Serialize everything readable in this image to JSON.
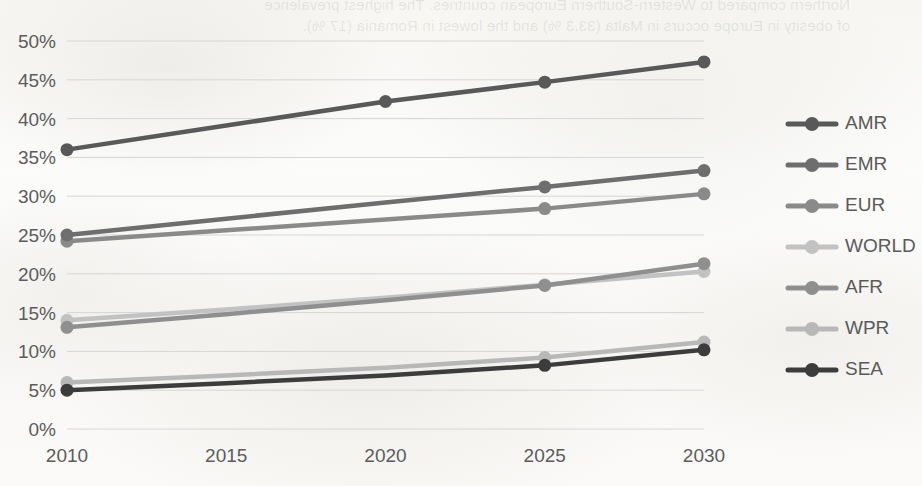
{
  "background": {
    "bleed_through_text": [
      "Northern compared to Western-Southern European countries.  The highest prevalence",
      "of obesity in Europe occurs in Malta (33.3 %) and the lowest in Romania (17 %)."
    ],
    "paper_color": "#fbfbfa"
  },
  "chart_data": {
    "type": "line",
    "title": "",
    "xlabel": "",
    "ylabel": "",
    "x": [
      2010,
      2015,
      2020,
      2025,
      2030
    ],
    "categories": [
      "2010",
      "2015",
      "2020",
      "2025",
      "2030"
    ],
    "xlim": [
      2010,
      2030
    ],
    "ylim": [
      0,
      50
    ],
    "y_tick_labels": [
      "0%",
      "5%",
      "10%",
      "15%",
      "20%",
      "25%",
      "30%",
      "35%",
      "40%",
      "45%",
      "50%"
    ],
    "y_tick_values": [
      0,
      5,
      10,
      15,
      20,
      25,
      30,
      35,
      40,
      45,
      50
    ],
    "x_tick_labels": [
      "2010",
      "2015",
      "2020",
      "2025",
      "2030"
    ],
    "grid": "horizontal",
    "legend_position": "right",
    "markers": true,
    "series": [
      {
        "name": "AMR",
        "color": "#595959",
        "values": [
          36.0,
          39.1,
          42.2,
          44.7,
          47.3
        ]
      },
      {
        "name": "EMR",
        "color": "#6e6e6e",
        "values": [
          25.0,
          27.1,
          29.2,
          31.2,
          33.3
        ]
      },
      {
        "name": "EUR",
        "color": "#8a8a8a",
        "values": [
          24.2,
          25.6,
          27.0,
          28.4,
          30.3
        ]
      },
      {
        "name": "WORLD",
        "color": "#c2c2c2",
        "values": [
          14.0,
          15.4,
          16.9,
          18.6,
          20.3
        ]
      },
      {
        "name": "AFR",
        "color": "#8f8f8f",
        "values": [
          13.1,
          14.8,
          16.6,
          18.5,
          21.3
        ]
      },
      {
        "name": "WPR",
        "color": "#b8b8b8",
        "values": [
          6.0,
          6.9,
          7.9,
          9.2,
          11.2
        ]
      },
      {
        "name": "SEA",
        "color": "#3c3c3c",
        "values": [
          5.0,
          5.9,
          6.9,
          8.2,
          10.2
        ]
      }
    ]
  },
  "legend": {
    "items": [
      {
        "label": "AMR",
        "color": "#595959"
      },
      {
        "label": "EMR",
        "color": "#6e6e6e"
      },
      {
        "label": "EUR",
        "color": "#8a8a8a"
      },
      {
        "label": "WORLD",
        "color": "#c2c2c2"
      },
      {
        "label": "AFR",
        "color": "#8f8f8f"
      },
      {
        "label": "WPR",
        "color": "#b8b8b8"
      },
      {
        "label": "SEA",
        "color": "#3c3c3c"
      }
    ]
  }
}
